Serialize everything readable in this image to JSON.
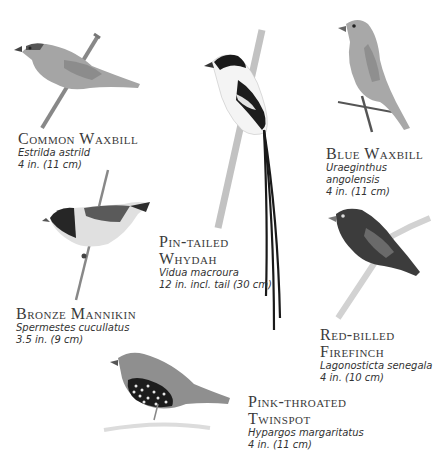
{
  "birds": [
    {
      "common_name": "Common Waxbill",
      "scientific_name": "Estrilda astrild",
      "size": "4 in. (11 cm)"
    },
    {
      "common_name": "Blue Waxbill",
      "scientific_name": "Uraeginthus angolensis",
      "size": "4 in. (11 cm)"
    },
    {
      "common_name_line1": "Pin-tailed",
      "common_name_line2": "Whydah",
      "scientific_name": "Vidua macroura",
      "size": "12 in. incl. tail (30 cm)"
    },
    {
      "common_name": "Bronze Mannikin",
      "scientific_name": "Spermestes cucullatus",
      "size": "3.5 in. (9 cm)"
    },
    {
      "common_name_line1": "Red-billed",
      "common_name_line2": "Firefinch",
      "scientific_name": "Lagonosticta senegala",
      "size": "4 in. (10 cm)"
    },
    {
      "common_name_line1": "Pink-throated",
      "common_name_line2": "Twinspot",
      "scientific_name": "Hypargos margaritatus",
      "size": "4 in. (11 cm)"
    }
  ]
}
